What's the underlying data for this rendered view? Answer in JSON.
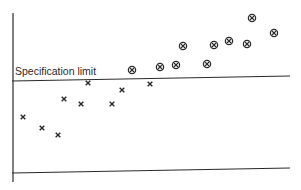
{
  "chart_data": {
    "type": "scatter",
    "title": "",
    "xlabel": "",
    "ylabel": "",
    "grid": false,
    "legend": null,
    "annotations": [
      {
        "text": "Specification limit",
        "kind": "horizontal-reference-line"
      }
    ],
    "reference_line": {
      "label": "Specification limit",
      "px": {
        "x1": 12,
        "y1": 81,
        "x2": 290,
        "y2": 76
      }
    },
    "axes": {
      "y_axis_px": {
        "x": 13,
        "y1": 13,
        "y2": 182
      },
      "x_axis_px": {
        "x1": 12,
        "y1": 173,
        "x2": 290,
        "y2": 168
      }
    },
    "series": [
      {
        "name": "Within limit",
        "marker": "x",
        "points_px": [
          {
            "x": 23,
            "y": 117
          },
          {
            "x": 42,
            "y": 128
          },
          {
            "x": 58,
            "y": 135
          },
          {
            "x": 64,
            "y": 99
          },
          {
            "x": 81,
            "y": 104
          },
          {
            "x": 88,
            "y": 83
          },
          {
            "x": 112,
            "y": 104
          },
          {
            "x": 122,
            "y": 90
          },
          {
            "x": 150,
            "y": 84
          }
        ]
      },
      {
        "name": "Above limit",
        "marker": "circled-x",
        "points_px": [
          {
            "x": 132,
            "y": 70
          },
          {
            "x": 160,
            "y": 67
          },
          {
            "x": 176,
            "y": 65
          },
          {
            "x": 183,
            "y": 46
          },
          {
            "x": 207,
            "y": 64
          },
          {
            "x": 214,
            "y": 45
          },
          {
            "x": 229,
            "y": 41
          },
          {
            "x": 247,
            "y": 44
          },
          {
            "x": 252,
            "y": 18
          },
          {
            "x": 274,
            "y": 33
          }
        ]
      }
    ]
  },
  "colors": {
    "ink": "#2a2a2a",
    "background": "#ffffff"
  }
}
